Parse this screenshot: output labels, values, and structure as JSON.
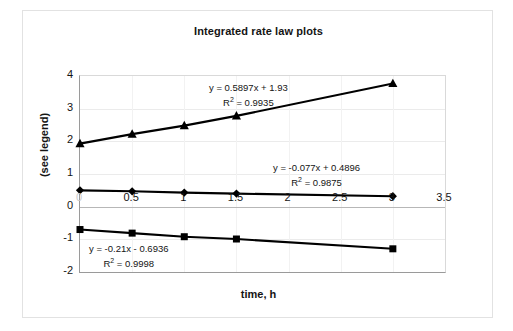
{
  "chart_data": {
    "type": "scatter",
    "title": "Integrated rate law plots",
    "xlabel": "time, h",
    "ylabel": "(see legend)",
    "xlim": [
      0,
      3.5
    ],
    "ylim": [
      -2,
      4
    ],
    "xticks": [
      "0",
      "0.5",
      "1",
      "1.5",
      "2",
      "2.5",
      "3",
      "3.5"
    ],
    "xtick_values": [
      0,
      0.5,
      1,
      1.5,
      2,
      2.5,
      3,
      3.5
    ],
    "yticks": [
      "4",
      "3",
      "2",
      "1",
      "0",
      "-1",
      "-2"
    ],
    "ytick_values": [
      4,
      3,
      2,
      1,
      0,
      -1,
      -2
    ],
    "grid": true,
    "legend": "none",
    "x": [
      0,
      0.5,
      1,
      1.5,
      3
    ],
    "series": [
      {
        "name": "triangle-series",
        "marker": "triangle",
        "color": "#000000",
        "values": [
          1.93,
          2.22,
          2.48,
          2.78,
          3.77
        ],
        "fit_equation": "y = 0.5897x + 1.93",
        "fit_r2_label": "R",
        "fit_r2_exp": "2",
        "fit_r2_value": " = 0.9935",
        "slope": 0.5897,
        "intercept": 1.93,
        "r2": 0.9935
      },
      {
        "name": "diamond-series",
        "marker": "diamond",
        "color": "#000000",
        "values": [
          0.5,
          0.47,
          0.43,
          0.4,
          0.32
        ],
        "fit_equation": "y = -0.077x + 0.4896",
        "fit_r2_label": "R",
        "fit_r2_exp": "2",
        "fit_r2_value": " = 0.9875",
        "slope": -0.077,
        "intercept": 0.4896,
        "r2": 0.9875
      },
      {
        "name": "square-series",
        "marker": "square",
        "color": "#000000",
        "values": [
          -0.7,
          -0.81,
          -0.92,
          -0.99,
          -1.29
        ],
        "fit_equation": "y = -0.21x - 0.6936",
        "fit_r2_label": "R",
        "fit_r2_exp": "2",
        "fit_r2_value": " = 0.9998",
        "slope": -0.21,
        "intercept": -0.6936,
        "r2": 0.9998
      }
    ]
  }
}
